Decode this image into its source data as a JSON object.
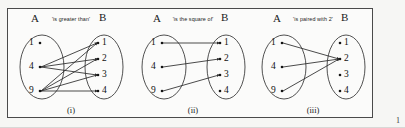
{
  "figure": {
    "page_number": "1",
    "set_a_label": "A",
    "set_b_label": "B",
    "panels": [
      {
        "caption": "(i)",
        "relation": "'is greater than'",
        "set_a": [
          "1",
          "4",
          "9"
        ],
        "set_b": [
          "1",
          "2",
          "3",
          "4"
        ],
        "arrows": [
          {
            "from": "4",
            "to": "1"
          },
          {
            "from": "4",
            "to": "2"
          },
          {
            "from": "4",
            "to": "3"
          },
          {
            "from": "9",
            "to": "1"
          },
          {
            "from": "9",
            "to": "2"
          },
          {
            "from": "9",
            "to": "3"
          },
          {
            "from": "9",
            "to": "4"
          }
        ]
      },
      {
        "caption": "(ii)",
        "relation": "'is the square of'",
        "set_a": [
          "1",
          "4",
          "9"
        ],
        "set_b": [
          "1",
          "2",
          "3",
          "4"
        ],
        "arrows": [
          {
            "from": "1",
            "to": "1"
          },
          {
            "from": "4",
            "to": "2"
          },
          {
            "from": "9",
            "to": "3"
          }
        ]
      },
      {
        "caption": "(iii)",
        "relation": "'is paired with 2'",
        "set_a": [
          "1",
          "4",
          "9"
        ],
        "set_b": [
          "1",
          "2",
          "3",
          "4"
        ],
        "arrows": [
          {
            "from": "1",
            "to": "2"
          },
          {
            "from": "4",
            "to": "2"
          },
          {
            "from": "9",
            "to": "2"
          }
        ]
      }
    ]
  }
}
